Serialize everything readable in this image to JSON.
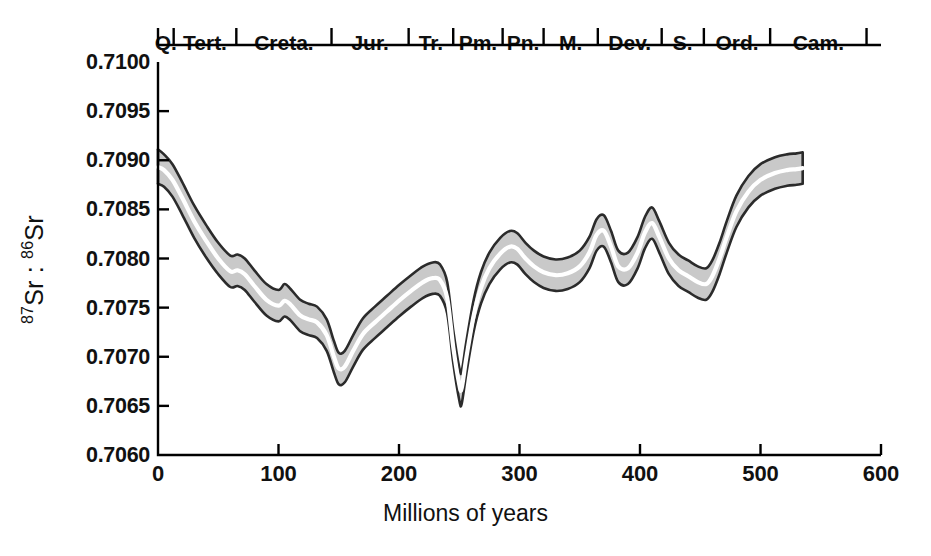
{
  "chart_data": {
    "type": "area",
    "title": "",
    "xlabel": "Millions of years",
    "ylabel": "87Sr : 86Sr",
    "ylabel_parts": {
      "sup1": "87",
      "mid": "Sr : ",
      "sup2": "86",
      "tail": "Sr"
    },
    "xlim": [
      0,
      600
    ],
    "ylim": [
      0.706,
      0.71
    ],
    "grid": false,
    "legend": "none",
    "xticks": [
      0,
      100,
      200,
      300,
      400,
      500,
      600
    ],
    "xtick_labels": [
      "0",
      "100",
      "200",
      "300",
      "400",
      "500",
      "600"
    ],
    "yticks": [
      0.706,
      0.7065,
      0.707,
      0.7075,
      0.708,
      0.7085,
      0.709,
      0.7095,
      0.71
    ],
    "ytick_labels": [
      "0.7060",
      "0.7065",
      "0.7070",
      "0.7075",
      "0.7080",
      "0.7085",
      "0.7090",
      "0.7095",
      "0.7100"
    ],
    "band_fill_color": "#c9c9c9",
    "band_outline_color": "#2b2b2b",
    "median_line_color": "#ffffff",
    "axis_color": "#000000",
    "series": [
      {
        "name": "87Sr:86Sr seawater curve (median)",
        "x": [
          0,
          5,
          12,
          20,
          30,
          40,
          50,
          60,
          66,
          72,
          80,
          90,
          100,
          105,
          110,
          118,
          125,
          132,
          140,
          146,
          150,
          155,
          162,
          170,
          180,
          190,
          200,
          210,
          220,
          228,
          234,
          240,
          245,
          250,
          252,
          256,
          262,
          268,
          275,
          284,
          292,
          298,
          305,
          312,
          320,
          330,
          340,
          350,
          358,
          364,
          370,
          376,
          382,
          390,
          398,
          404,
          410,
          416,
          424,
          432,
          440,
          448,
          455,
          460,
          466,
          472,
          480,
          490,
          500,
          512,
          522,
          530,
          535
        ],
        "values": [
          0.70893,
          0.7089,
          0.7088,
          0.70862,
          0.70838,
          0.70818,
          0.708,
          0.70787,
          0.70788,
          0.70784,
          0.70772,
          0.70758,
          0.70752,
          0.70757,
          0.70753,
          0.70742,
          0.70738,
          0.70735,
          0.70722,
          0.707,
          0.70688,
          0.7069,
          0.70706,
          0.70723,
          0.70735,
          0.70746,
          0.70757,
          0.70767,
          0.70776,
          0.7078,
          0.70778,
          0.7076,
          0.7071,
          0.70672,
          0.70668,
          0.707,
          0.70742,
          0.7077,
          0.7079,
          0.70805,
          0.70812,
          0.7081,
          0.708,
          0.70792,
          0.70786,
          0.70783,
          0.70785,
          0.70792,
          0.70806,
          0.70824,
          0.70828,
          0.70812,
          0.70792,
          0.7079,
          0.70806,
          0.70826,
          0.70836,
          0.70822,
          0.708,
          0.70788,
          0.70782,
          0.70776,
          0.70774,
          0.70782,
          0.708,
          0.70822,
          0.70848,
          0.70868,
          0.7088,
          0.70887,
          0.7089,
          0.70891,
          0.70892
        ]
      },
      {
        "name": "upper bound",
        "x": [
          0,
          5,
          12,
          20,
          30,
          40,
          50,
          60,
          66,
          72,
          80,
          90,
          100,
          105,
          110,
          118,
          125,
          132,
          140,
          146,
          150,
          155,
          162,
          170,
          180,
          190,
          200,
          210,
          220,
          228,
          234,
          240,
          245,
          250,
          252,
          256,
          262,
          268,
          275,
          284,
          292,
          298,
          305,
          312,
          320,
          330,
          340,
          350,
          358,
          364,
          370,
          376,
          382,
          390,
          398,
          404,
          410,
          416,
          424,
          432,
          440,
          448,
          455,
          460,
          466,
          472,
          480,
          490,
          500,
          512,
          522,
          530,
          535
        ],
        "values": [
          0.70911,
          0.70906,
          0.70896,
          0.70878,
          0.70854,
          0.70834,
          0.70816,
          0.70803,
          0.70804,
          0.708,
          0.70788,
          0.70774,
          0.70768,
          0.70774,
          0.70769,
          0.70758,
          0.70754,
          0.70751,
          0.70738,
          0.70716,
          0.70704,
          0.70706,
          0.70722,
          0.70739,
          0.70751,
          0.70762,
          0.70773,
          0.70783,
          0.70792,
          0.70796,
          0.70794,
          0.70776,
          0.70727,
          0.70689,
          0.70685,
          0.70716,
          0.70758,
          0.70786,
          0.70806,
          0.70821,
          0.70828,
          0.70826,
          0.70816,
          0.70808,
          0.70802,
          0.70799,
          0.70801,
          0.70808,
          0.70822,
          0.7084,
          0.70844,
          0.70828,
          0.70808,
          0.70806,
          0.70822,
          0.70842,
          0.70852,
          0.70838,
          0.70816,
          0.70804,
          0.70798,
          0.70792,
          0.7079,
          0.70798,
          0.70816,
          0.70838,
          0.70864,
          0.70884,
          0.70896,
          0.70903,
          0.70906,
          0.70907,
          0.70908
        ]
      },
      {
        "name": "lower bound",
        "x": [
          0,
          5,
          12,
          20,
          30,
          40,
          50,
          60,
          66,
          72,
          80,
          90,
          100,
          105,
          110,
          118,
          125,
          132,
          140,
          146,
          150,
          155,
          162,
          170,
          180,
          190,
          200,
          210,
          220,
          228,
          234,
          240,
          245,
          250,
          252,
          256,
          262,
          268,
          275,
          284,
          292,
          298,
          305,
          312,
          320,
          330,
          340,
          350,
          358,
          364,
          370,
          376,
          382,
          390,
          398,
          404,
          410,
          416,
          424,
          432,
          440,
          448,
          455,
          460,
          466,
          472,
          480,
          490,
          500,
          512,
          522,
          530,
          535
        ],
        "values": [
          0.70876,
          0.70873,
          0.70863,
          0.70845,
          0.70821,
          0.70801,
          0.70784,
          0.70771,
          0.70772,
          0.70768,
          0.70756,
          0.70742,
          0.70736,
          0.70741,
          0.70737,
          0.70726,
          0.70722,
          0.70719,
          0.70706,
          0.70684,
          0.70672,
          0.70674,
          0.7069,
          0.70707,
          0.70719,
          0.7073,
          0.70741,
          0.70751,
          0.7076,
          0.70764,
          0.70762,
          0.70744,
          0.70694,
          0.70656,
          0.70652,
          0.70684,
          0.70726,
          0.70754,
          0.70774,
          0.70789,
          0.70796,
          0.70794,
          0.70784,
          0.70776,
          0.7077,
          0.70767,
          0.70769,
          0.70776,
          0.7079,
          0.70808,
          0.70812,
          0.70796,
          0.70776,
          0.70774,
          0.7079,
          0.7081,
          0.7082,
          0.70806,
          0.70784,
          0.70772,
          0.70766,
          0.7076,
          0.70758,
          0.70766,
          0.70784,
          0.70806,
          0.70832,
          0.70852,
          0.70864,
          0.70871,
          0.70874,
          0.70875,
          0.70876
        ]
      }
    ],
    "geologic_periods": [
      {
        "label": "Q.",
        "start": 0,
        "end": 13
      },
      {
        "label": "Tert.",
        "start": 13,
        "end": 65
      },
      {
        "label": "Creta.",
        "start": 65,
        "end": 144
      },
      {
        "label": "Jur.",
        "start": 144,
        "end": 208
      },
      {
        "label": "Tr.",
        "start": 208,
        "end": 245
      },
      {
        "label": "Pm.",
        "start": 245,
        "end": 286
      },
      {
        "label": "Pn.",
        "start": 286,
        "end": 320
      },
      {
        "label": "M.",
        "start": 320,
        "end": 365
      },
      {
        "label": "Dev.",
        "start": 365,
        "end": 418
      },
      {
        "label": "S.",
        "start": 418,
        "end": 453
      },
      {
        "label": "Ord.",
        "start": 453,
        "end": 508
      },
      {
        "label": "Cam.",
        "start": 508,
        "end": 588
      }
    ]
  }
}
